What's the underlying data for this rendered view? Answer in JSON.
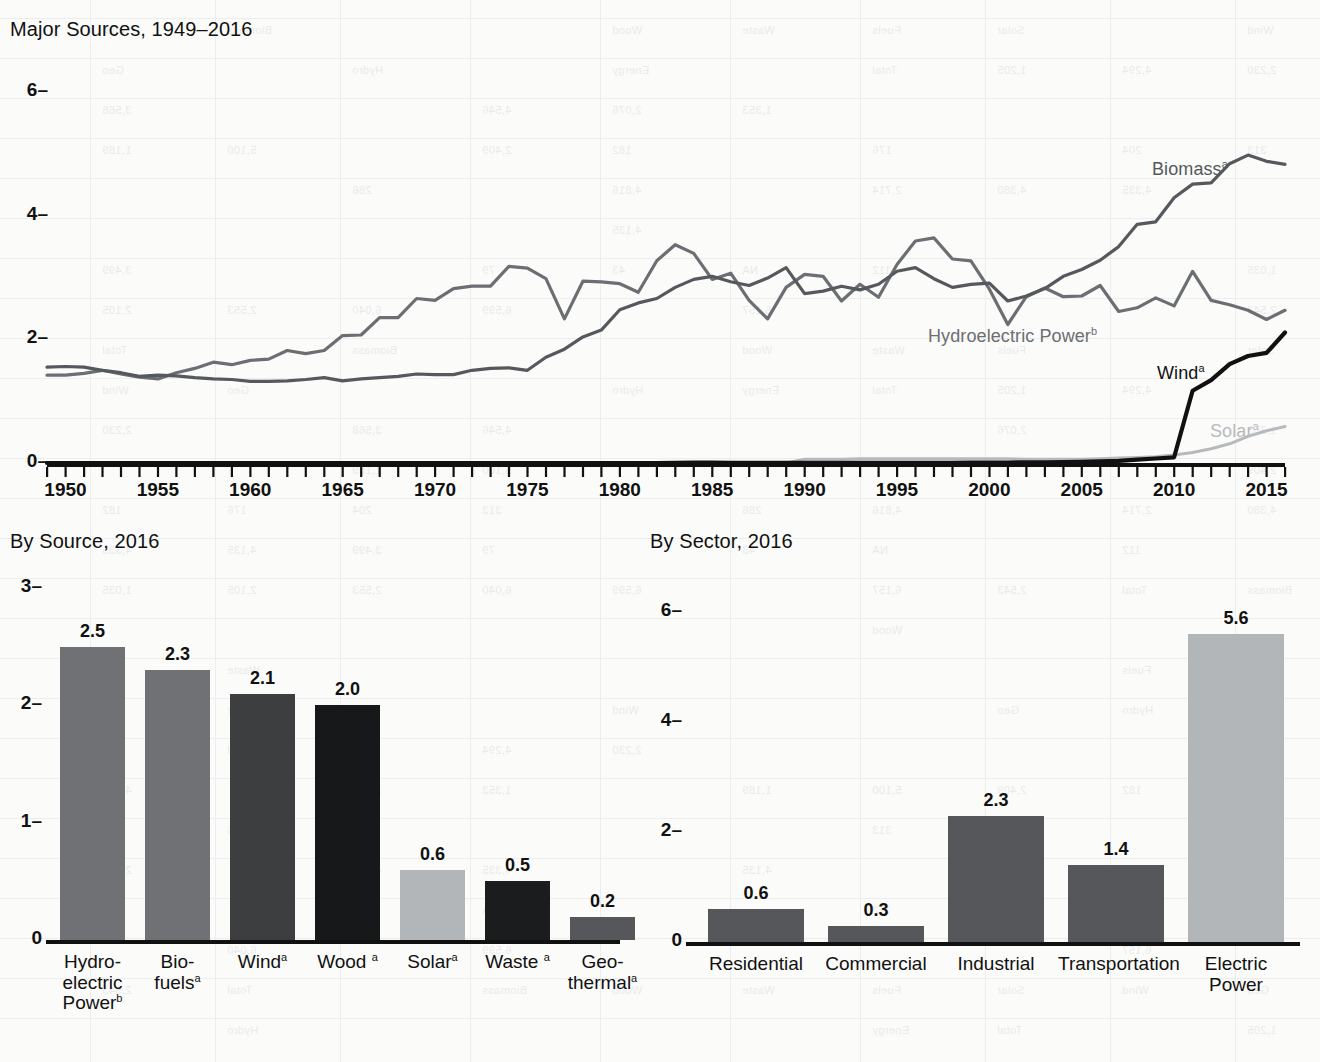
{
  "figure": {
    "units_note": "quadrillion Btu"
  },
  "line_chart": {
    "title": "Major Sources, 1949–2016",
    "y_ticks": [
      "0",
      "2",
      "4",
      "6"
    ],
    "x_ticks": [
      "1950",
      "1955",
      "1960",
      "1965",
      "1970",
      "1975",
      "1980",
      "1985",
      "1990",
      "1995",
      "2000",
      "2005",
      "2010",
      "2015"
    ],
    "series_labels": [
      {
        "name": "biomass-label",
        "text": "Biomass",
        "sup": "a",
        "color": "#55585c"
      },
      {
        "name": "hydro-label",
        "text": "Hydroelectric Power",
        "sup": "b",
        "color": "#6b6e72"
      },
      {
        "name": "wind-label",
        "text": "Wind",
        "sup": "a",
        "color": "#111111"
      },
      {
        "name": "solar-label",
        "text": "Solar",
        "sup": "a",
        "color": "#b7babd"
      }
    ]
  },
  "by_source_chart": {
    "title": "By Source, 2016",
    "y_ticks": [
      "0",
      "1",
      "2",
      "3"
    ]
  },
  "by_sector_chart": {
    "title": "By Sector, 2016",
    "y_ticks": [
      "0",
      "2",
      "4",
      "6"
    ]
  },
  "chart_data": [
    {
      "type": "line",
      "id": "major-sources",
      "title": "Major Sources, 1949–2016",
      "xlabel": "",
      "ylabel": "",
      "xlim": [
        1949,
        2016
      ],
      "ylim": [
        0,
        6
      ],
      "yticks": [
        0,
        2,
        4,
        6
      ],
      "xticks": [
        1950,
        1955,
        1960,
        1965,
        1970,
        1975,
        1980,
        1985,
        1990,
        1995,
        2000,
        2005,
        2010,
        2015
      ],
      "grid": false,
      "legend": "inline-labels",
      "x": [
        1949,
        1950,
        1951,
        1952,
        1953,
        1954,
        1955,
        1956,
        1957,
        1958,
        1959,
        1960,
        1961,
        1962,
        1963,
        1964,
        1965,
        1966,
        1967,
        1968,
        1969,
        1970,
        1971,
        1972,
        1973,
        1974,
        1975,
        1976,
        1977,
        1978,
        1979,
        1980,
        1981,
        1982,
        1983,
        1984,
        1985,
        1986,
        1987,
        1988,
        1989,
        1990,
        1991,
        1992,
        1993,
        1994,
        1995,
        1996,
        1997,
        1998,
        1999,
        2000,
        2001,
        2002,
        2003,
        2004,
        2005,
        2006,
        2007,
        2008,
        2009,
        2010,
        2011,
        2012,
        2013,
        2014,
        2015,
        2016
      ],
      "series": [
        {
          "name": "Biomass",
          "footnote": "a",
          "color": "#55585c",
          "values": [
            1.55,
            1.56,
            1.55,
            1.5,
            1.46,
            1.4,
            1.42,
            1.41,
            1.38,
            1.36,
            1.35,
            1.32,
            1.32,
            1.33,
            1.35,
            1.38,
            1.33,
            1.36,
            1.38,
            1.4,
            1.44,
            1.43,
            1.43,
            1.5,
            1.53,
            1.54,
            1.5,
            1.71,
            1.84,
            2.04,
            2.15,
            2.48,
            2.59,
            2.66,
            2.84,
            2.97,
            3.02,
            2.93,
            2.87,
            2.99,
            3.16,
            2.74,
            2.78,
            2.86,
            2.8,
            2.89,
            3.1,
            3.16,
            2.98,
            2.84,
            2.89,
            2.91,
            2.62,
            2.7,
            2.82,
            3.02,
            3.13,
            3.28,
            3.5,
            3.86,
            3.9,
            4.29,
            4.51,
            4.53,
            4.84,
            4.98,
            4.88,
            4.83
          ]
        },
        {
          "name": "Hydroelectric Power",
          "footnote": "b",
          "color": "#6b6e72",
          "values": [
            1.42,
            1.42,
            1.45,
            1.5,
            1.44,
            1.39,
            1.36,
            1.46,
            1.53,
            1.63,
            1.59,
            1.66,
            1.68,
            1.82,
            1.77,
            1.82,
            2.06,
            2.07,
            2.35,
            2.35,
            2.66,
            2.63,
            2.82,
            2.86,
            2.86,
            3.18,
            3.15,
            2.98,
            2.33,
            2.94,
            2.93,
            2.9,
            2.76,
            3.27,
            3.53,
            3.39,
            2.97,
            3.07,
            2.63,
            2.33,
            2.84,
            3.05,
            3.02,
            2.62,
            2.89,
            2.68,
            3.21,
            3.59,
            3.64,
            3.3,
            3.27,
            2.81,
            2.24,
            2.69,
            2.83,
            2.69,
            2.7,
            2.87,
            2.45,
            2.51,
            2.67,
            2.54,
            3.1,
            2.63,
            2.56,
            2.47,
            2.32,
            2.47
          ]
        },
        {
          "name": "Wind",
          "footnote": "a",
          "color": "#111111",
          "values": [
            0,
            0,
            0,
            0,
            0,
            0,
            0,
            0,
            0,
            0,
            0,
            0,
            0,
            0,
            0,
            0,
            0,
            0,
            0,
            0,
            0,
            0,
            0,
            0,
            0,
            0,
            0,
            0,
            0,
            0,
            0,
            0,
            0,
            0,
            0.001,
            0.006,
            0.006,
            0.004,
            0.004,
            0.003,
            0.003,
            0.003,
            0.003,
            0.003,
            0.003,
            0.004,
            0.003,
            0.003,
            0.003,
            0.003,
            0.005,
            0.006,
            0.007,
            0.011,
            0.012,
            0.014,
            0.018,
            0.026,
            0.034,
            0.055,
            0.072,
            0.092,
            1.17,
            1.34,
            1.6,
            1.73,
            1.78,
            2.11
          ]
        },
        {
          "name": "Solar",
          "footnote": "a",
          "color": "#b7babd",
          "values": [
            0,
            0,
            0,
            0,
            0,
            0,
            0,
            0,
            0,
            0,
            0,
            0,
            0,
            0,
            0,
            0,
            0,
            0,
            0,
            0,
            0,
            0,
            0,
            0,
            0,
            0,
            0,
            0,
            0,
            0,
            0,
            0,
            0,
            0,
            0.001,
            0.002,
            0.002,
            0.002,
            0.002,
            0.002,
            0.002,
            0.06,
            0.06,
            0.06,
            0.07,
            0.07,
            0.07,
            0.07,
            0.07,
            0.07,
            0.07,
            0.07,
            0.07,
            0.06,
            0.06,
            0.06,
            0.06,
            0.07,
            0.08,
            0.09,
            0.1,
            0.13,
            0.17,
            0.23,
            0.31,
            0.43,
            0.52,
            0.59
          ]
        }
      ]
    },
    {
      "type": "bar",
      "id": "by-source-2016",
      "title": "By Source, 2016",
      "xlabel": "",
      "ylabel": "",
      "ylim": [
        0,
        3
      ],
      "yticks": [
        0,
        1,
        2,
        3
      ],
      "grid": false,
      "categories": [
        "Hydro-electric Power",
        "Bio-fuels",
        "Wind",
        "Wood",
        "Solar",
        "Waste",
        "Geo-thermal"
      ],
      "category_lines": [
        [
          "Hydro-",
          "electric",
          "Power"
        ],
        [
          "Bio-",
          "fuels"
        ],
        [
          "Wind"
        ],
        [
          "Wood "
        ],
        [
          "Solar"
        ],
        [
          "Waste "
        ],
        [
          "Geo-",
          "thermal"
        ]
      ],
      "footnotes": [
        "b",
        "a",
        "a",
        "a",
        "a",
        "a",
        "a"
      ],
      "values": [
        2.5,
        2.3,
        2.1,
        2.0,
        0.6,
        0.5,
        0.2
      ],
      "colors": [
        "#6f7174",
        "#6f7174",
        "#3c3e40",
        "#171819",
        "#b3b6b8",
        "#1b1c1d",
        "#55575a"
      ]
    },
    {
      "type": "bar",
      "id": "by-sector-2016",
      "title": "By Sector, 2016",
      "xlabel": "",
      "ylabel": "",
      "ylim": [
        0,
        6
      ],
      "yticks": [
        0,
        2,
        4,
        6
      ],
      "grid": false,
      "categories": [
        "Residential",
        "Commercial",
        "Industrial",
        "Transportation",
        "Electric Power"
      ],
      "category_lines": [
        [
          "Residential"
        ],
        [
          "Commercial"
        ],
        [
          "Industrial"
        ],
        [
          "Transportation"
        ],
        [
          "Electric",
          "Power"
        ]
      ],
      "values": [
        0.6,
        0.3,
        2.3,
        1.4,
        5.6
      ],
      "colors": [
        "#55575a",
        "#55575a",
        "#55575a",
        "#55575a",
        "#b3b6b8"
      ]
    }
  ]
}
